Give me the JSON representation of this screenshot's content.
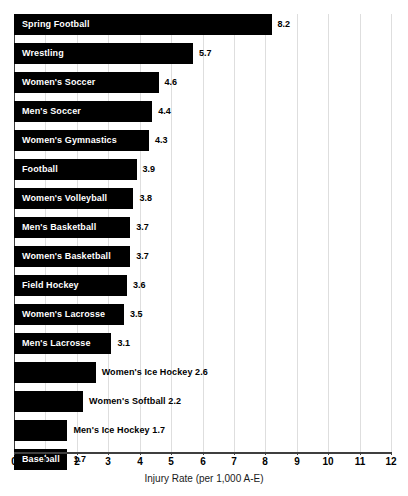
{
  "chart_data": {
    "type": "bar",
    "orientation": "horizontal",
    "title": "",
    "xlabel": "Injury Rate (per 1,000 A-E)",
    "ylabel": "",
    "xlim": [
      0,
      12
    ],
    "xticks": [
      "0",
      "1",
      "2",
      "3",
      "4",
      "5",
      "6",
      "7",
      "8",
      "9",
      "10",
      "11",
      "12"
    ],
    "grid": true,
    "legend": null,
    "bar_color": "#000000",
    "gridline_color": "#dedede",
    "axis_color": "#3f3f3f",
    "categories": [
      "Spring Football",
      "Wrestling",
      "Women's Soccer",
      "Men's Soccer",
      "Women's Gymnastics",
      "Football",
      "Women's Volleyball",
      "Men's Basketball",
      "Women's Basketball",
      "Field Hockey",
      "Women's Lacrosse",
      "Men's Lacrosse",
      "Women's Ice Hockey",
      "Women's Softball",
      "Men's Ice Hockey",
      "Baseball"
    ],
    "values": [
      8.2,
      5.7,
      4.6,
      4.4,
      4.3,
      3.9,
      3.8,
      3.7,
      3.7,
      3.6,
      3.5,
      3.1,
      2.6,
      2.2,
      1.7,
      1.7
    ],
    "value_labels": [
      "8.2",
      "5.7",
      "4.6",
      "4.4",
      "4.3",
      "3.9",
      "3.8",
      "3.7",
      "3.7",
      "3.6",
      "3.5",
      "3.1",
      "2.6",
      "2.2",
      "1.7",
      "1.7"
    ],
    "bars": [
      {
        "category": "Spring Football",
        "value": 8.2,
        "value_label": "8.2",
        "label_placement": "inside",
        "combined_label": "Spring Football"
      },
      {
        "category": "Wrestling",
        "value": 5.7,
        "value_label": "5.7",
        "label_placement": "inside",
        "combined_label": "Wrestling"
      },
      {
        "category": "Women's Soccer",
        "value": 4.6,
        "value_label": "4.6",
        "label_placement": "inside",
        "combined_label": "Women's Soccer"
      },
      {
        "category": "Men's Soccer",
        "value": 4.4,
        "value_label": "4.4",
        "label_placement": "inside",
        "combined_label": "Men's Soccer"
      },
      {
        "category": "Women's Gymnastics",
        "value": 4.3,
        "value_label": "4.3",
        "label_placement": "inside",
        "combined_label": "Women's Gymnastics"
      },
      {
        "category": "Football",
        "value": 3.9,
        "value_label": "3.9",
        "label_placement": "inside",
        "combined_label": "Football"
      },
      {
        "category": "Women's Volleyball",
        "value": 3.8,
        "value_label": "3.8",
        "label_placement": "inside",
        "combined_label": "Women's Volleyball"
      },
      {
        "category": "Men's Basketball",
        "value": 3.7,
        "value_label": "3.7",
        "label_placement": "inside",
        "combined_label": "Men's Basketball"
      },
      {
        "category": "Women's Basketball",
        "value": 3.7,
        "value_label": "3.7",
        "label_placement": "inside",
        "combined_label": "Women's Basketball"
      },
      {
        "category": "Field Hockey",
        "value": 3.6,
        "value_label": "3.6",
        "label_placement": "inside",
        "combined_label": "Field Hockey"
      },
      {
        "category": "Women's Lacrosse",
        "value": 3.5,
        "value_label": "3.5",
        "label_placement": "inside",
        "combined_label": "Women's Lacrosse"
      },
      {
        "category": "Men's Lacrosse",
        "value": 3.1,
        "value_label": "3.1",
        "label_placement": "inside",
        "combined_label": "Men's Lacrosse"
      },
      {
        "category": "Women's Ice Hockey",
        "value": 2.6,
        "value_label": "2.6",
        "label_placement": "outside",
        "combined_label": "Women's Ice Hockey 2.6"
      },
      {
        "category": "Women's Softball",
        "value": 2.2,
        "value_label": "2.2",
        "label_placement": "outside",
        "combined_label": "Women's Softball 2.2"
      },
      {
        "category": "Men's Ice Hockey",
        "value": 1.7,
        "value_label": "1.7",
        "label_placement": "outside",
        "combined_label": "Men's Ice Hockey 1.7"
      },
      {
        "category": "Baseball",
        "value": 1.7,
        "value_label": "1.7",
        "label_placement": "inside",
        "combined_label": "Baseball"
      }
    ]
  }
}
